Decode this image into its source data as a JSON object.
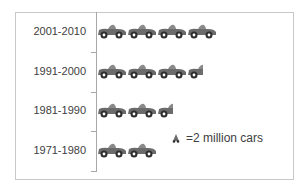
{
  "chart_data": {
    "type": "bar",
    "subtype": "pictograph",
    "orientation": "horizontal",
    "title": "",
    "xlabel": "",
    "ylabel": "",
    "categories": [
      "2001-2010",
      "1991-2000",
      "1981-1990",
      "1971-1980"
    ],
    "icon_counts": [
      4,
      3.5,
      2.5,
      2
    ],
    "values": [
      8,
      7,
      5,
      4
    ],
    "unit": "million cars",
    "legend": {
      "icon": "car-icon",
      "text": "=2 million cars",
      "value_per_icon": 2
    },
    "grid": false
  },
  "labels": {
    "row0": "2001-2010",
    "row1": "1991-2000",
    "row2": "1981-1990",
    "row3": "1971-1980"
  },
  "legend": {
    "text": "=2 million cars"
  },
  "colors": {
    "car_body": "#6b6b6b",
    "car_roof": "#8a8a8a",
    "wheel": "#2e2e2e",
    "hub": "#ffffff",
    "frame": "#c8c8c8",
    "axis": "#a8a8a8",
    "text": "#404040"
  }
}
